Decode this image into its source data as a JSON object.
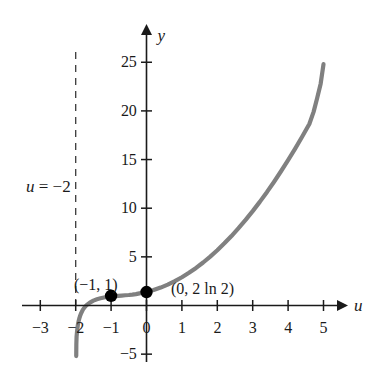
{
  "figure": {
    "background_color": "#ffffff",
    "curve_color": "#808080",
    "axis_color": "#1a1a1a",
    "point_color": "#000000"
  },
  "axes": {
    "x_axis_label": "u",
    "y_axis_label": "y",
    "x_ticks": [
      {
        "value": -3,
        "label": "−3"
      },
      {
        "value": -2,
        "label": "−2"
      },
      {
        "value": -1,
        "label": "−1"
      },
      {
        "value": 0,
        "label": "0"
      },
      {
        "value": 1,
        "label": "1"
      },
      {
        "value": 2,
        "label": "2"
      },
      {
        "value": 3,
        "label": "3"
      },
      {
        "value": 4,
        "label": "4"
      },
      {
        "value": 5,
        "label": "5"
      }
    ],
    "y_ticks": [
      {
        "value": 25,
        "label": "25"
      },
      {
        "value": 20,
        "label": "20"
      },
      {
        "value": 15,
        "label": "15"
      },
      {
        "value": 10,
        "label": "10"
      },
      {
        "value": 5,
        "label": "5"
      },
      {
        "value": -5,
        "label": "−5"
      }
    ]
  },
  "annotations": {
    "asymptote_label": "u = −2",
    "asymptote_label_var": "u",
    "asymptote_label_rest": " = −2",
    "point_left_label": "(−1, 1)",
    "point_origin_label": "(0, 2 ln 2)"
  },
  "points": [
    {
      "name": "point-minus1-1",
      "x": -1,
      "y": 1,
      "label": "(−1, 1)"
    },
    {
      "name": "point-0-2ln2",
      "x": 0,
      "y": 1.386,
      "label": "(0, 2 ln 2)"
    }
  ],
  "chart_data": {
    "type": "line",
    "title": "",
    "xlabel": "u",
    "ylabel": "y",
    "xlim": [
      -3,
      5.4
    ],
    "ylim": [
      -5,
      26
    ],
    "grid": false,
    "legend": "none",
    "vertical_asymptote": -2,
    "asymptote_style": "dashed",
    "series": [
      {
        "name": "y = u^2 + 2 ln(u + 2)",
        "x": [
          -1.96,
          -1.94,
          -1.92,
          -1.9,
          -1.88,
          -1.85,
          -1.8,
          -1.75,
          -1.7,
          -1.6,
          -1.5,
          -1.4,
          -1.3,
          -1.2,
          -1.1,
          -1.0,
          -0.9,
          -0.8,
          -0.7,
          -0.6,
          -0.5,
          -0.4,
          -0.3,
          -0.2,
          -0.1,
          0.0,
          0.2,
          0.4,
          0.6,
          0.8,
          1.0,
          1.2,
          1.4,
          1.6,
          1.8,
          2.0,
          2.2,
          2.4,
          2.6,
          2.8,
          3.0,
          3.2,
          3.4,
          3.6,
          3.8,
          4.0,
          4.2,
          4.4,
          4.6
        ],
        "y": [
          -2.59,
          -2.02,
          -1.65,
          -1.35,
          -1.11,
          -0.82,
          -0.45,
          -0.19,
          0.01,
          0.3,
          0.5,
          0.64,
          0.74,
          0.82,
          0.88,
          0.93,
          0.96,
          0.99,
          1.02,
          1.05,
          1.08,
          1.12,
          1.17,
          1.24,
          1.31,
          1.39,
          1.59,
          1.84,
          2.14,
          2.5,
          2.9,
          3.36,
          3.86,
          4.42,
          5.03,
          5.68,
          6.39,
          7.14,
          7.95,
          8.8,
          9.7,
          10.65,
          11.65,
          12.7,
          13.8,
          14.94,
          16.13,
          17.37,
          18.66
        ],
        "endpoint_y_approx": 25
      }
    ]
  }
}
